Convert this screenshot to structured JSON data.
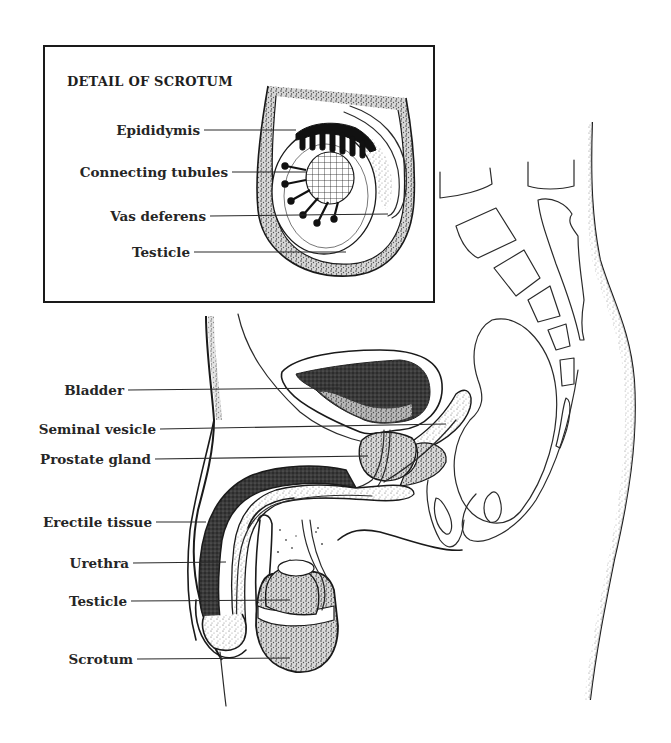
{
  "figure": {
    "inset_title": "DETAIL OF SCROTUM",
    "inset_labels": [
      {
        "text": "Epididymis"
      },
      {
        "text": "Connecting tubules"
      },
      {
        "text": "Vas deferens"
      },
      {
        "text": "Testicle"
      }
    ],
    "main_labels": [
      {
        "text": "Bladder"
      },
      {
        "text": "Seminal vesicle"
      },
      {
        "text": "Prostate gland"
      },
      {
        "text": "Erectile tissue"
      },
      {
        "text": "Urethra"
      },
      {
        "text": "Testicle"
      },
      {
        "text": "Scrotum"
      }
    ],
    "colors": {
      "ink": "#1a1a1a",
      "background": "#ffffff",
      "stipple_dark": "#2b2b2b",
      "stipple_light": "#9a9a9a"
    }
  }
}
